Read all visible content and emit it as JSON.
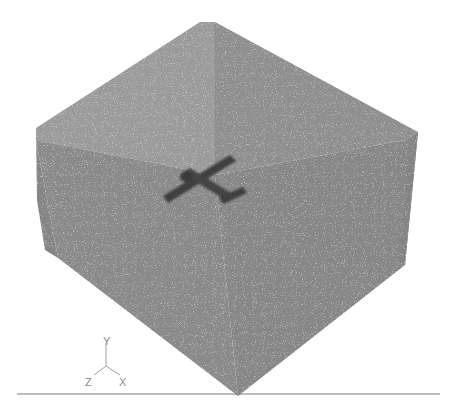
{
  "viewport": {
    "background": "#ffffff",
    "mesh_color_light": "#9a9a9a",
    "mesh_color_mid": "#8c8c8c",
    "mesh_color_dark": "#858585",
    "edge_color": "#7a7a7a"
  },
  "model": {
    "domain_box": {
      "name": "fluid-domain-box",
      "outer_silhouette": [
        [
          36,
          128
        ],
        [
          200,
          22
        ],
        [
          215,
          22
        ],
        [
          418,
          132
        ],
        [
          405,
          265
        ],
        [
          238,
          396
        ],
        [
          58,
          258
        ]
      ],
      "interior_back_edge": [
        [
          215,
          22
        ],
        [
          215,
          175
        ]
      ],
      "left_inner_face": [
        [
          36,
          128
        ],
        [
          200,
          22
        ],
        [
          215,
          22
        ],
        [
          215,
          175
        ],
        [
          36,
          140
        ]
      ],
      "right_inner_face": [
        [
          215,
          22
        ],
        [
          418,
          132
        ],
        [
          405,
          140
        ],
        [
          215,
          175
        ]
      ],
      "front_left_face": [
        [
          36,
          140
        ],
        [
          215,
          175
        ],
        [
          238,
          396
        ],
        [
          58,
          258
        ]
      ],
      "front_right_face": [
        [
          215,
          175
        ],
        [
          405,
          140
        ],
        [
          405,
          265
        ],
        [
          238,
          396
        ]
      ]
    },
    "aircraft": {
      "name": "airplane-model",
      "color": "#3f3f3f",
      "wing": [
        [
          163,
          196
        ],
        [
          230,
          155
        ],
        [
          236,
          161
        ],
        [
          168,
          203
        ]
      ],
      "fuselage": [
        [
          181,
          173
        ],
        [
          190,
          168
        ],
        [
          236,
          196
        ],
        [
          229,
          202
        ]
      ],
      "tail": [
        [
          219,
          197
        ],
        [
          243,
          187
        ],
        [
          247,
          193
        ],
        [
          223,
          204
        ]
      ]
    }
  },
  "triad": {
    "labels": {
      "y": "Y",
      "z": "Z",
      "x": "X"
    },
    "color": "#9a9a9a"
  },
  "ground_line": {
    "y": 394,
    "x_start": 17,
    "x_end": 440,
    "color": "#7d7d7d"
  }
}
